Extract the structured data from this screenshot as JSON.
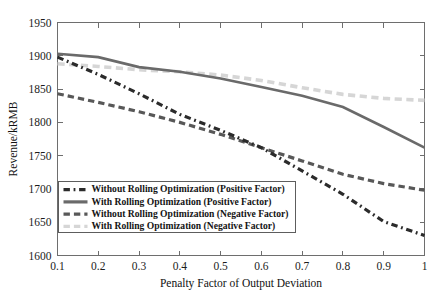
{
  "chart_data": {
    "type": "line",
    "title": "",
    "xlabel": "Penalty Factor of Output Deviation",
    "ylabel": "Revenue/kRMB",
    "xlim": [
      0.1,
      1.0
    ],
    "ylim": [
      1600,
      1950
    ],
    "xticks": [
      0.1,
      0.2,
      0.3,
      0.4,
      0.5,
      0.6,
      0.7,
      0.8,
      0.9,
      1
    ],
    "xticklabels": [
      "0.1",
      "0.2",
      "0.3",
      "0.4",
      "0.5",
      "0.6",
      "0.7",
      "0.8",
      "0.9",
      "1"
    ],
    "yticks": [
      1600,
      1650,
      1700,
      1750,
      1800,
      1850,
      1900,
      1950
    ],
    "yticklabels": [
      "1600",
      "1650",
      "1700",
      "1750",
      "1800",
      "1850",
      "1900",
      "1950"
    ],
    "grid": false,
    "legend_position": "lower-left",
    "x": [
      0.1,
      0.2,
      0.3,
      0.4,
      0.5,
      0.6,
      0.7,
      0.8,
      0.9,
      1
    ],
    "series": [
      {
        "name": "Without Rolling Optimization (Positive Factor)",
        "values": [
          1898,
          1872,
          1843,
          1812,
          1788,
          1762,
          1727,
          1692,
          1651,
          1630
        ],
        "color": "#2b2b2b",
        "style": "dashdot",
        "width": 3.2
      },
      {
        "name": "With Rolling Optimization (Positive Factor)",
        "values": [
          1903,
          1898,
          1883,
          1876,
          1866,
          1853,
          1840,
          1823,
          1793,
          1762
        ],
        "color": "#6a6a6a",
        "style": "solid",
        "width": 2.6
      },
      {
        "name": "Without Rolling Optimization (Negative Factor)",
        "values": [
          1843,
          1830,
          1816,
          1800,
          1782,
          1762,
          1742,
          1722,
          1708,
          1698
        ],
        "color": "#585858",
        "style": "dashed",
        "width": 3.2
      },
      {
        "name": "With Rolling Optimization (Negative Factor)",
        "values": [
          1888,
          1884,
          1879,
          1876,
          1871,
          1863,
          1852,
          1842,
          1836,
          1833
        ],
        "color": "#d6d6d6",
        "style": "dashed",
        "width": 3.6
      }
    ],
    "legend": [
      {
        "label": "Without Rolling Optimization (Positive Factor)",
        "color": "#2b2b2b",
        "style": "dashdot"
      },
      {
        "label": "With Rolling Optimization (Positive Factor)",
        "color": "#6a6a6a",
        "style": "solid"
      },
      {
        "label": "Without Rolling Optimization (Negative Factor)",
        "color": "#585858",
        "style": "dashed"
      },
      {
        "label": "With Rolling Optimization (Negative Factor)",
        "color": "#d6d6d6",
        "style": "dashed"
      }
    ]
  }
}
